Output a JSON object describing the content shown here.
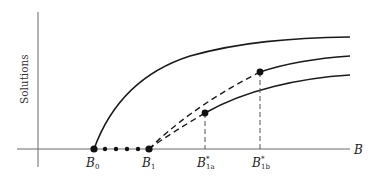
{
  "diagram": {
    "y_axis_label": "Solutions",
    "x_axis_label": "B",
    "labels": {
      "b0": {
        "main": "B",
        "sub": "0"
      },
      "b1": {
        "main": "B",
        "sub": "1"
      },
      "b1a": {
        "main": "B",
        "sup": "*",
        "sub": "1a"
      },
      "b1b": {
        "main": "B",
        "sup": "*",
        "sub": "1b"
      }
    },
    "elements": [
      {
        "type": "solid-curve",
        "description": "Upper branch from B0 rising and saturating"
      },
      {
        "type": "dotted-segment",
        "description": "Dotted points along B axis between B0 and B1"
      },
      {
        "type": "dashed-curve",
        "description": "Unstable dashed branch from B1 to B1b*"
      },
      {
        "type": "dashed-curve",
        "description": "Unstable dashed branch from B1 to B1a*"
      },
      {
        "type": "solid-curve",
        "description": "Middle branch from B1b* point"
      },
      {
        "type": "solid-curve",
        "description": "Lower branch from B1a* point"
      }
    ],
    "colors": {
      "line": "#1a1a1a",
      "axis": "#6a6a6a"
    }
  }
}
